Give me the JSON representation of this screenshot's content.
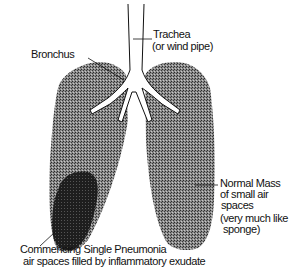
{
  "diagram": {
    "labels": {
      "trachea_line1": "Trachea",
      "trachea_line2": "(or wind pipe)",
      "bronchus": "Bronchus",
      "normal_line1": "Normal Mass",
      "normal_line2": "of small air",
      "normal_line3": "spaces",
      "normal_line4": "(very much like",
      "normal_line5": "sponge)",
      "pneumonia_line1": "Commencing Single Pneumonia",
      "pneumonia_line2": "air spaces filled by inflammatory exudate"
    },
    "colors": {
      "lung_tissue": "#6a6a6a",
      "pneumonia_patch": "#1e1e1e",
      "airway": "#ffffff",
      "ink": "#111111"
    }
  }
}
